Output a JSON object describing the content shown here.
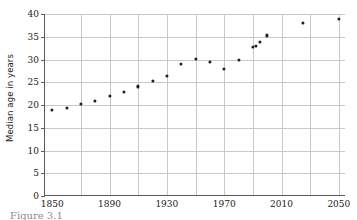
{
  "figure": {
    "caption": "Figure 3.1"
  },
  "chart_data": {
    "type": "scatter",
    "title": "",
    "xlabel": "",
    "ylabel": "Median age in years",
    "xlim": [
      1845,
      2055
    ],
    "ylim": [
      0,
      40
    ],
    "grid": true,
    "legend": "none",
    "marker_color": "#1f1f1f",
    "grid_color": "#c9c9c9",
    "axis_color": "#5a5a5a",
    "xticks": [
      1850,
      1890,
      1930,
      1970,
      2010,
      2050
    ],
    "xtick_labels": [
      "1850",
      "1890",
      "1930",
      "1970",
      "2010",
      "2050"
    ],
    "x_minor_ticks": [
      1870,
      1910,
      1950,
      1990,
      2030
    ],
    "yticks": [
      0,
      5,
      10,
      15,
      20,
      25,
      30,
      35,
      40
    ],
    "ytick_labels": [
      "0",
      "5",
      "10",
      "15",
      "20",
      "25",
      "30",
      "35",
      "40"
    ],
    "points": [
      {
        "x": 1850,
        "y": 19.0
      },
      {
        "x": 1860,
        "y": 19.4
      },
      {
        "x": 1870,
        "y": 20.2
      },
      {
        "x": 1880,
        "y": 20.9
      },
      {
        "x": 1890,
        "y": 22.0
      },
      {
        "x": 1900,
        "y": 22.9
      },
      {
        "x": 1910,
        "y": 24.1
      },
      {
        "x": 1920,
        "y": 25.3
      },
      {
        "x": 1930,
        "y": 26.4
      },
      {
        "x": 1940,
        "y": 29.0
      },
      {
        "x": 1950,
        "y": 30.2
      },
      {
        "x": 1960,
        "y": 29.5
      },
      {
        "x": 1970,
        "y": 28.0
      },
      {
        "x": 1980,
        "y": 30.0
      },
      {
        "x": 1990,
        "y": 32.8
      },
      {
        "x": 1992,
        "y": 32.9
      },
      {
        "x": 1995,
        "y": 33.9
      },
      {
        "x": 2000,
        "y": 35.3
      },
      {
        "x": 2025,
        "y": 38.0
      },
      {
        "x": 2050,
        "y": 39.0
      }
    ]
  }
}
